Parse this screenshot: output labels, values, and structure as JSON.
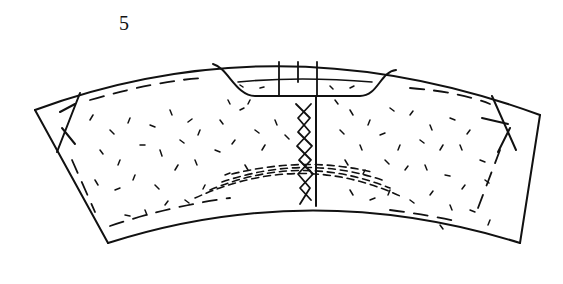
{
  "figure": {
    "label": "5",
    "stroke_color": "#111111",
    "background_color": "#ffffff",
    "elements": {
      "outline": "annular-sector outline",
      "notch": "central trapezoidal recess at top with curved flanks",
      "center_joint": "vertical joint line",
      "top_dividers": "three short vertical lines in the notch band",
      "zigzag": "cross-hatched zig-zag along the central joint",
      "side_hatches": "diagonal crossing lines near the left and right edges",
      "bottom_arcs": "concentric dashed arcs near the bottom center",
      "stipple": "random short-dash texture fill"
    }
  }
}
